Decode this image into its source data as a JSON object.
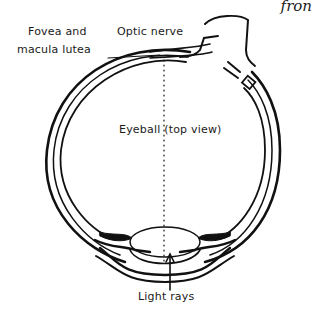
{
  "figure": {
    "title": "Eyeball (top view)",
    "corner_text": "fron",
    "labels": {
      "fovea_line1": "Fovea and",
      "fovea_line2": "macula lutea",
      "optic_nerve": "Optic nerve",
      "light_rays": "Light rays"
    },
    "stroke_color": "#111111"
  }
}
